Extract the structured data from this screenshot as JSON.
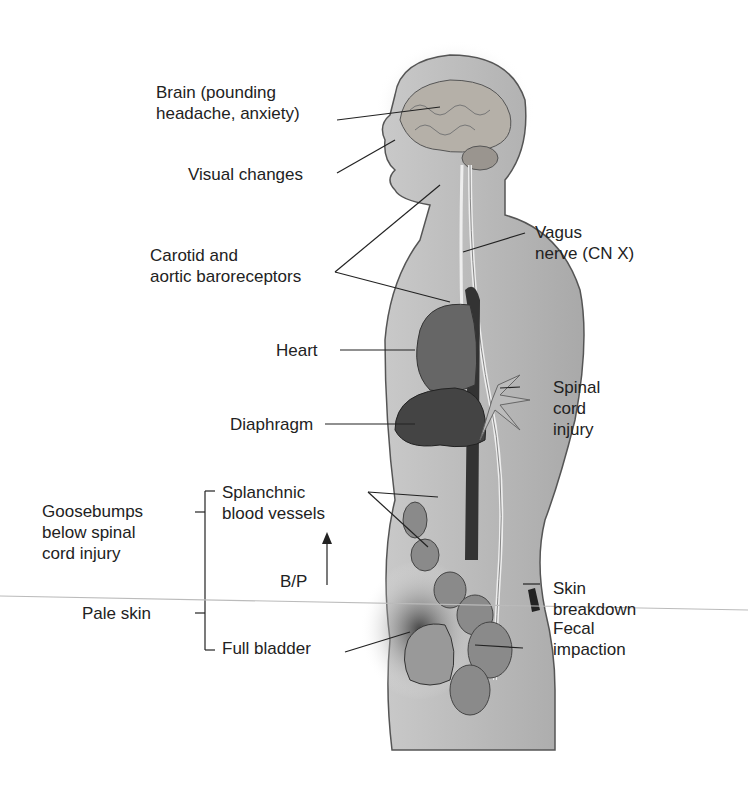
{
  "labels": {
    "brain": [
      "Brain (pounding",
      "headache, anxiety)"
    ],
    "visual": "Visual changes",
    "baroreceptors": [
      "Carotid and",
      "aortic baroreceptors"
    ],
    "vagus": [
      "Vagus",
      "nerve (CN X)"
    ],
    "heart": "Heart",
    "diaphragm": "Diaphragm",
    "spinal": [
      "Spinal",
      "cord",
      "injury"
    ],
    "splanchnic": [
      "Splanchnic",
      "blood vessels"
    ],
    "goosebumps": [
      "Goosebumps",
      "below spinal",
      "cord injury"
    ],
    "bp": "B/P",
    "skin_breakdown": [
      "Skin",
      "breakdown"
    ],
    "pale_skin": "Pale skin",
    "full_bladder": "Full bladder",
    "fecal": [
      "Fecal",
      "impaction"
    ]
  }
}
